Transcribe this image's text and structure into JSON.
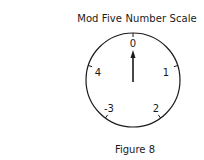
{
  "title": "Mod Five Number Scale",
  "caption": "Figure 8",
  "dial": {
    "labels": [
      {
        "position": "top",
        "text": "0"
      },
      {
        "position": "upper-right",
        "text": "1"
      },
      {
        "position": "lower-right",
        "text": "2"
      },
      {
        "position": "lower-left",
        "text": "-3"
      },
      {
        "position": "upper-left",
        "text": "4"
      }
    ],
    "pointer": "0"
  }
}
